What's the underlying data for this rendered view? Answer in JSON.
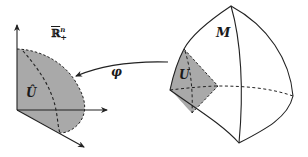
{
  "figure": {
    "colors": {
      "background": "#ffffff",
      "stroke": "#222222",
      "shaded_region": "#a9a9a9"
    }
  },
  "labels": {
    "half_space": {
      "base": "ℝ",
      "superscript": "n",
      "subscript": "+",
      "overline": true
    },
    "chart_image": "Û",
    "map": "φ",
    "manifold": "M",
    "open_set": "U"
  },
  "left_panel": {
    "axes": [
      "vertical-axis-arrow",
      "horizontal-axis-arrow",
      "diagonal-axis-arrow"
    ],
    "region": "Û (shaded, dashed boundary)"
  },
  "right_panel": {
    "shape": "curved tetrahedral surface M",
    "region": "U (shaded, dashed boundary)"
  },
  "arrow": {
    "from": "U",
    "to": "Û",
    "label": "φ"
  }
}
